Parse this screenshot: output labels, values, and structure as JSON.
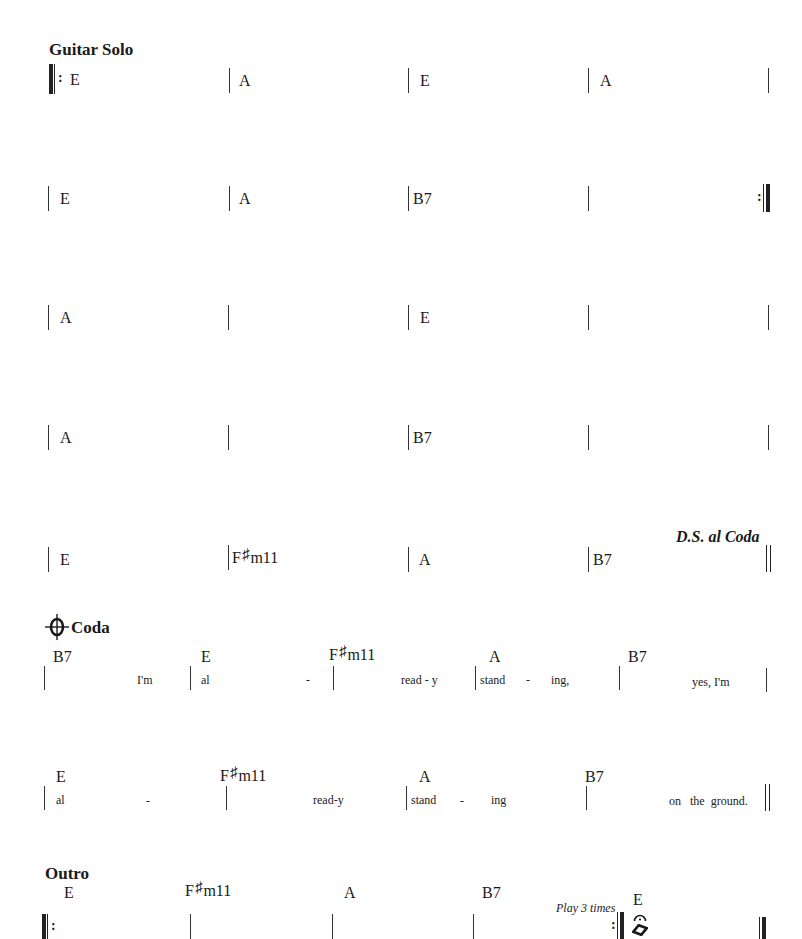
{
  "sections": {
    "guitar_solo": {
      "title": "Guitar Solo",
      "rows": [
        {
          "chords": [
            "E",
            "A",
            "E",
            "A"
          ],
          "start": "repeat-start",
          "end": "single"
        },
        {
          "chords": [
            "E",
            "A",
            "B7",
            ""
          ],
          "start": "single",
          "end": "repeat-end"
        },
        {
          "chords": [
            "A",
            "",
            "E",
            ""
          ],
          "start": "single",
          "end": "single"
        },
        {
          "chords": [
            "A",
            "",
            "B7",
            ""
          ],
          "start": "single",
          "end": "single"
        },
        {
          "chords": [
            "E",
            "F#m11",
            "A",
            "B7"
          ],
          "start": "single",
          "end": "double",
          "direction": "D.S. al Coda"
        }
      ]
    },
    "coda": {
      "symbol": "coda-sign",
      "title": "Coda",
      "rows": [
        {
          "chords": [
            "B7",
            "E",
            "F#m11",
            "A",
            "B7"
          ],
          "lyrics": [
            "I'm",
            "al",
            "-",
            "read - y",
            "stand",
            "-",
            "ing,",
            "yes, I'm"
          ]
        },
        {
          "chords": [
            "E",
            "F#m11",
            "A",
            "B7"
          ],
          "lyrics": [
            "al",
            "-",
            "read-y",
            "stand",
            "-",
            "ing",
            "on   the  ground."
          ]
        }
      ]
    },
    "outro": {
      "title": "Outro",
      "chords": [
        "E",
        "F#m11",
        "A",
        "B7",
        "E"
      ],
      "instruction": "Play 3 times",
      "fermata": "fermata-icon",
      "diamond": "diamond-note-icon"
    }
  },
  "chord_parts": {
    "fsharp_root": "F",
    "sharp": "♯",
    "fsharp_suffix": "m11"
  },
  "colors": {
    "ink": "#1a1a1a",
    "paper": "#ffffff"
  }
}
